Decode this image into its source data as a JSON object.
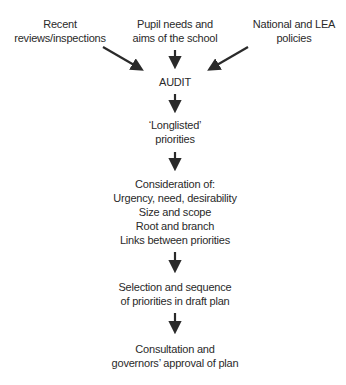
{
  "diagram": {
    "type": "flowchart",
    "inputs": [
      {
        "id": "reviews",
        "lines": [
          "Recent",
          "reviews/inspections"
        ]
      },
      {
        "id": "pupil",
        "lines": [
          "Pupil needs and",
          "aims of the school"
        ]
      },
      {
        "id": "national",
        "lines": [
          "National and LEA",
          "policies"
        ]
      }
    ],
    "steps": [
      {
        "id": "audit",
        "lines": [
          "AUDIT"
        ]
      },
      {
        "id": "longlisted",
        "lines": [
          "‘Longlisted’",
          "priorities"
        ]
      },
      {
        "id": "consideration",
        "lines": [
          "Consideration of:",
          "Urgency, need, desirability",
          "Size and scope",
          "Root and branch",
          "Links between priorities"
        ]
      },
      {
        "id": "selection",
        "lines": [
          "Selection and sequence",
          "of priorities in draft plan"
        ]
      },
      {
        "id": "consultation",
        "lines": [
          "Consultation and",
          "governors’ approval of plan"
        ]
      }
    ],
    "edges": [
      [
        "reviews",
        "audit"
      ],
      [
        "pupil",
        "audit"
      ],
      [
        "national",
        "audit"
      ],
      [
        "audit",
        "longlisted"
      ],
      [
        "longlisted",
        "consideration"
      ],
      [
        "consideration",
        "selection"
      ],
      [
        "selection",
        "consultation"
      ]
    ],
    "arrow_color": "#2a2a2a"
  }
}
